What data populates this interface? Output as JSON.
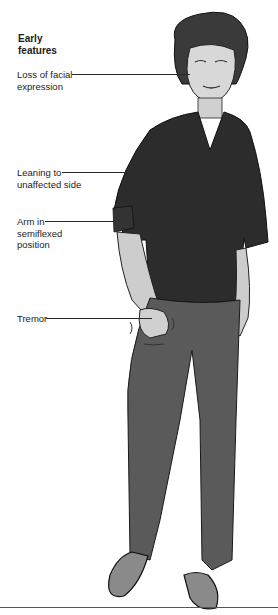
{
  "figure": {
    "title": "Early features",
    "labels": [
      {
        "id": "facial",
        "text": "Loss of facial expression",
        "line1": "Loss of facial",
        "line2": "expression"
      },
      {
        "id": "leaning",
        "text": "Leaning to unaffected side",
        "line1": "Leaning to",
        "line2": "unaffected side"
      },
      {
        "id": "arm",
        "text": "Arm in semiflexed position",
        "line1": "Arm in",
        "line2": "semiflexed",
        "line3": "position"
      },
      {
        "id": "tremor",
        "text": "Tremor",
        "line1": "Tremor"
      }
    ]
  },
  "colors": {
    "shirt": "#2c2c2c",
    "pants": "#5a5a5a",
    "skin": "#cfcfcf",
    "hair": "#3a3a3a",
    "shoes": "#8a8a8a",
    "line": "#222222"
  }
}
